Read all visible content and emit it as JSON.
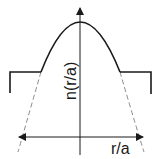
{
  "diagram": {
    "title": "",
    "type": "refractive-index-profile",
    "x_axis": {
      "label": "r/a",
      "direction": "bidirectional"
    },
    "y_axis": {
      "label": "n(r/a)",
      "direction": "up"
    },
    "curves": [
      {
        "name": "graded-index-core",
        "shape": "parabola",
        "style": "solid"
      },
      {
        "name": "parabola-extension",
        "shape": "parabola",
        "style": "dashed"
      },
      {
        "name": "cladding-step-left",
        "shape": "step",
        "style": "solid"
      },
      {
        "name": "cladding-step-right",
        "shape": "step",
        "style": "solid"
      }
    ],
    "colors": {
      "line": "#1a1a1a",
      "dashed": "#8a8a8a",
      "background": "#ffffff"
    }
  }
}
